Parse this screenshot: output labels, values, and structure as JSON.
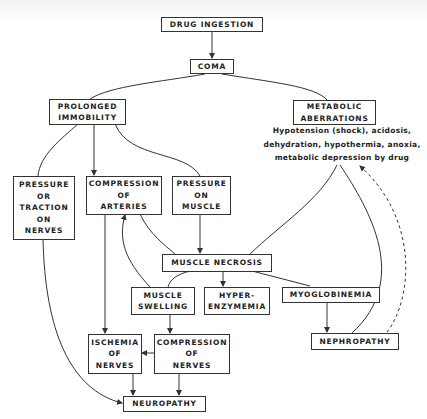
{
  "diagram": {
    "type": "flowchart",
    "nodes": {
      "drug_ingestion": {
        "lines": [
          "DRUG INGESTION"
        ]
      },
      "coma": {
        "lines": [
          "COMA"
        ]
      },
      "prolonged_immobility": {
        "lines": [
          "PROLONGED",
          "IMMOBILITY"
        ]
      },
      "metabolic_aberrations": {
        "lines": [
          "METABOLIC",
          "ABERRATIONS"
        ]
      },
      "metabolic_note": {
        "lines": [
          "Hypotension (shock), acidosis,",
          "dehydration, hypothermia, anoxia,",
          "metabolic depression by drug"
        ]
      },
      "pressure_traction_nerves": {
        "lines": [
          "PRESSURE",
          "OR",
          "TRACTION",
          "ON",
          "NERVES"
        ]
      },
      "compression_arteries": {
        "lines": [
          "COMPRESSION",
          "OF",
          "ARTERIES"
        ]
      },
      "pressure_muscle": {
        "lines": [
          "PRESSURE",
          "ON",
          "MUSCLE"
        ]
      },
      "muscle_necrosis": {
        "lines": [
          "MUSCLE NECROSIS"
        ]
      },
      "muscle_swelling": {
        "lines": [
          "MUSCLE",
          "SWELLING"
        ]
      },
      "hyperenzymemia": {
        "lines": [
          "HYPER-",
          "ENZYMEMIA"
        ]
      },
      "myoglobinemia": {
        "lines": [
          "MYOGLOBINEMIA"
        ]
      },
      "nephropathy": {
        "lines": [
          "NEPHROPATHY"
        ]
      },
      "ischemia_nerves": {
        "lines": [
          "ISCHEMIA",
          "OF",
          "NERVES"
        ]
      },
      "compression_nerves": {
        "lines": [
          "COMPRESSION",
          "OF",
          "NERVES"
        ]
      },
      "neuropathy": {
        "lines": [
          "NEUROPATHY"
        ]
      }
    },
    "edges": [
      {
        "from": "drug_ingestion",
        "to": "coma",
        "style": "arrow"
      },
      {
        "from": "coma",
        "to": "prolonged_immobility",
        "style": "line"
      },
      {
        "from": "coma",
        "to": "metabolic_aberrations",
        "style": "line"
      },
      {
        "from": "prolonged_immobility",
        "to": "pressure_traction_nerves",
        "style": "line"
      },
      {
        "from": "prolonged_immobility",
        "to": "compression_arteries",
        "style": "arrow"
      },
      {
        "from": "prolonged_immobility",
        "to": "pressure_muscle",
        "style": "line"
      },
      {
        "from": "metabolic_note",
        "to": "muscle_necrosis",
        "style": "line"
      },
      {
        "from": "metabolic_note",
        "to": "nephropathy",
        "style": "line"
      },
      {
        "from": "nephropathy",
        "to": "metabolic_note",
        "style": "dashed-arrow"
      },
      {
        "from": "compression_arteries",
        "to": "muscle_necrosis",
        "style": "line"
      },
      {
        "from": "pressure_muscle",
        "to": "muscle_necrosis",
        "style": "arrow"
      },
      {
        "from": "muscle_swelling",
        "to": "compression_arteries",
        "style": "arrow"
      },
      {
        "from": "muscle_necrosis",
        "to": "muscle_swelling",
        "style": "line"
      },
      {
        "from": "muscle_necrosis",
        "to": "hyperenzymemia",
        "style": "arrow"
      },
      {
        "from": "muscle_necrosis",
        "to": "myoglobinemia",
        "style": "line"
      },
      {
        "from": "myoglobinemia",
        "to": "nephropathy",
        "style": "arrow"
      },
      {
        "from": "compression_arteries",
        "to": "ischemia_nerves",
        "style": "arrow"
      },
      {
        "from": "muscle_swelling",
        "to": "compression_nerves",
        "style": "arrow"
      },
      {
        "from": "compression_nerves",
        "to": "ischemia_nerves",
        "style": "arrow"
      },
      {
        "from": "ischemia_nerves",
        "to": "neuropathy",
        "style": "arrow"
      },
      {
        "from": "compression_nerves",
        "to": "neuropathy",
        "style": "arrow"
      },
      {
        "from": "pressure_traction_nerves",
        "to": "neuropathy",
        "style": "arrow"
      }
    ],
    "colors": {
      "ink": "#222222",
      "background": "#ffffff"
    }
  }
}
